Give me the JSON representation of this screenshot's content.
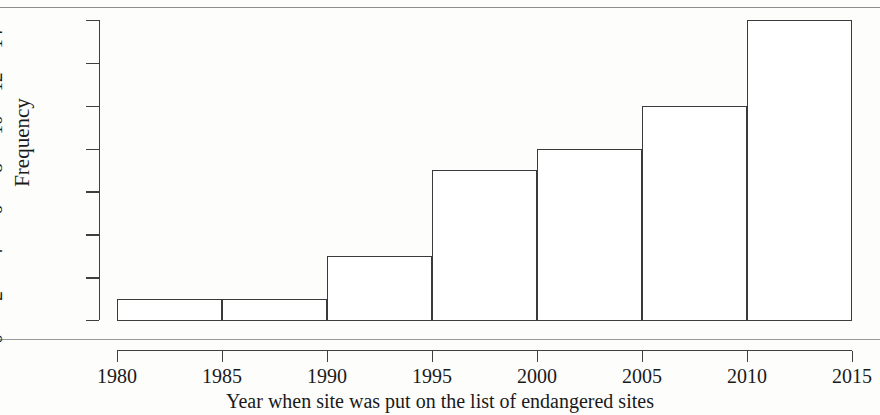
{
  "chart_data": {
    "type": "bar",
    "title": "",
    "subtitle": "",
    "xlabel": "Year when site was put on the list of endangered sites",
    "ylabel": "Frequency",
    "bin_edges": [
      1980,
      1985,
      1990,
      1995,
      2000,
      2005,
      2010,
      2015
    ],
    "bin_width": 5,
    "categories": [
      "1980–1985",
      "1985–1990",
      "1990–1995",
      "1995–2000",
      "2000–2005",
      "2005–2010",
      "2010–2015"
    ],
    "values": [
      1,
      1,
      3,
      7,
      8,
      10,
      14
    ],
    "bars": [
      {
        "label": "1980–1985",
        "start": 1980,
        "end": 1985,
        "value": 1
      },
      {
        "label": "1985–1990",
        "start": 1985,
        "end": 1990,
        "value": 1
      },
      {
        "label": "1990–1995",
        "start": 1990,
        "end": 1995,
        "value": 3
      },
      {
        "label": "1995–2000",
        "start": 1995,
        "end": 2000,
        "value": 7
      },
      {
        "label": "2000–2005",
        "start": 2000,
        "end": 2005,
        "value": 8
      },
      {
        "label": "2005–2010",
        "start": 2005,
        "end": 2010,
        "value": 10
      },
      {
        "label": "2010–2015",
        "start": 2010,
        "end": 2015,
        "value": 14
      }
    ],
    "xlim": [
      1980,
      2015
    ],
    "ylim": [
      0,
      14
    ],
    "x_ticks": [
      "1980",
      "1985",
      "1990",
      "1995",
      "2000",
      "2005",
      "2010",
      "2015"
    ],
    "x_tick_values": [
      1980,
      1985,
      1990,
      1995,
      2000,
      2005,
      2010,
      2015
    ],
    "y_ticks": [
      "0",
      "2",
      "4",
      "6",
      "8",
      "10",
      "12",
      "14"
    ],
    "y_tick_values": [
      0,
      2,
      4,
      6,
      8,
      10,
      12,
      14
    ],
    "grid": false,
    "legend": null,
    "legend_position": "none",
    "bar_fill": "#ffffff",
    "bar_stroke": "#3a3a3a",
    "background": "#fdfdfc",
    "axis_color": "#3f3f3f"
  }
}
